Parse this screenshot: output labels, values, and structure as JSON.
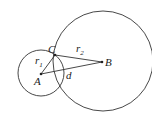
{
  "diagram": {
    "points": {
      "A": {
        "label": "A",
        "x": 41,
        "y": 74
      },
      "B": {
        "label": "B",
        "x": 102,
        "y": 62
      },
      "C": {
        "label": "C",
        "x": 55,
        "y": 55
      }
    },
    "circles": [
      {
        "name": "circle-a",
        "cx": 41,
        "cy": 73,
        "r": 23
      },
      {
        "name": "circle-b",
        "cx": 103,
        "cy": 61,
        "r": 50
      }
    ],
    "segment_labels": {
      "r1_base": "r",
      "r1_sub": "1",
      "r2_base": "r",
      "r2_sub": "2",
      "d": "d"
    },
    "colors": {
      "stroke": "#333333"
    }
  }
}
